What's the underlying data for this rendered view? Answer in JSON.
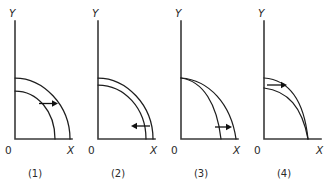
{
  "figure": {
    "background_color": "#ffffff",
    "stroke_color": "#1e1e1e",
    "axis_color": "#3a3a3a",
    "panels": [
      {
        "id": "panel-1",
        "caption": "(1)",
        "y_axis_label": "Y",
        "x_axis_label": "X",
        "origin_label": "0",
        "arrow_direction": "right",
        "arrow_meaning": "outward-shift",
        "curves": [
          {
            "name": "inner-curve",
            "y_intercept_frac": 0.78,
            "x_intercept_frac": 0.7,
            "shape": "quarter-circle"
          },
          {
            "name": "outer-curve",
            "y_intercept_frac": 1.0,
            "x_intercept_frac": 1.0,
            "shape": "quarter-circle"
          }
        ]
      },
      {
        "id": "panel-2",
        "caption": "(2)",
        "y_axis_label": "Y",
        "x_axis_label": "X",
        "origin_label": "0",
        "arrow_direction": "left",
        "arrow_meaning": "inward-shift",
        "curves": [
          {
            "name": "inner-curve",
            "y_intercept_frac": 0.88,
            "x_intercept_frac": 0.86,
            "shape": "quarter-circle"
          },
          {
            "name": "outer-curve",
            "y_intercept_frac": 1.0,
            "x_intercept_frac": 1.0,
            "shape": "quarter-circle"
          }
        ]
      },
      {
        "id": "panel-3",
        "caption": "(3)",
        "y_axis_label": "Y",
        "x_axis_label": "X",
        "origin_label": "0",
        "arrow_direction": "right",
        "arrow_meaning": "pivot-outward-on-x-axis",
        "curves": [
          {
            "name": "inner-curve",
            "y_intercept_frac": 1.0,
            "x_intercept_frac": 0.8,
            "shape": "concave-pivot"
          },
          {
            "name": "outer-curve",
            "y_intercept_frac": 1.0,
            "x_intercept_frac": 1.0,
            "shape": "concave-pivot"
          }
        ]
      },
      {
        "id": "panel-4",
        "caption": "(4)",
        "y_axis_label": "Y",
        "x_axis_label": "X",
        "origin_label": "0",
        "arrow_direction": "right",
        "arrow_meaning": "pivot-outward-on-y-axis",
        "curves": [
          {
            "name": "inner-curve",
            "y_intercept_frac": 0.86,
            "x_intercept_frac": 1.0,
            "shape": "concave-pivot"
          },
          {
            "name": "outer-curve",
            "y_intercept_frac": 1.0,
            "x_intercept_frac": 1.0,
            "shape": "concave-pivot"
          }
        ]
      }
    ]
  },
  "labels": {
    "y": "Y",
    "x": "X",
    "origin": "0",
    "caption_1": "(1)",
    "caption_2": "(2)",
    "caption_3": "(3)",
    "caption_4": "(4)"
  }
}
